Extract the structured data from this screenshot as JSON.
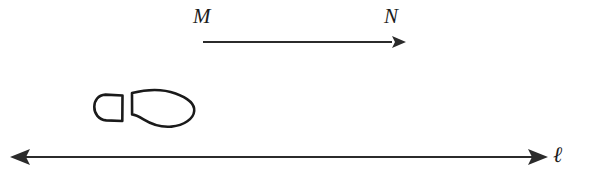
{
  "figure": {
    "kind": "geometry-translation-diagram",
    "background_color": "#ffffff",
    "ink_color": "#2b2b2b",
    "outline_color": "#1a1a1a",
    "width": 600,
    "height": 187,
    "labels": {
      "vector_start": "M",
      "vector_end": "N",
      "line": "ℓ"
    },
    "vector_MN": {
      "name": "translation-vector-MN",
      "x1": 203,
      "y1": 42,
      "x2": 403,
      "y2": 42,
      "arrowheads": "end",
      "direction": "right"
    },
    "line_ell": {
      "name": "line-ell",
      "x1": 12,
      "y1": 157,
      "x2": 546,
      "y2": 157,
      "arrowheads": "both",
      "direction": "horizontal"
    },
    "footprint": {
      "name": "footprint-outline",
      "parts": [
        "heel",
        "sole"
      ],
      "bbox": {
        "x": 94,
        "y": 90,
        "width": 102,
        "height": 38
      }
    }
  }
}
